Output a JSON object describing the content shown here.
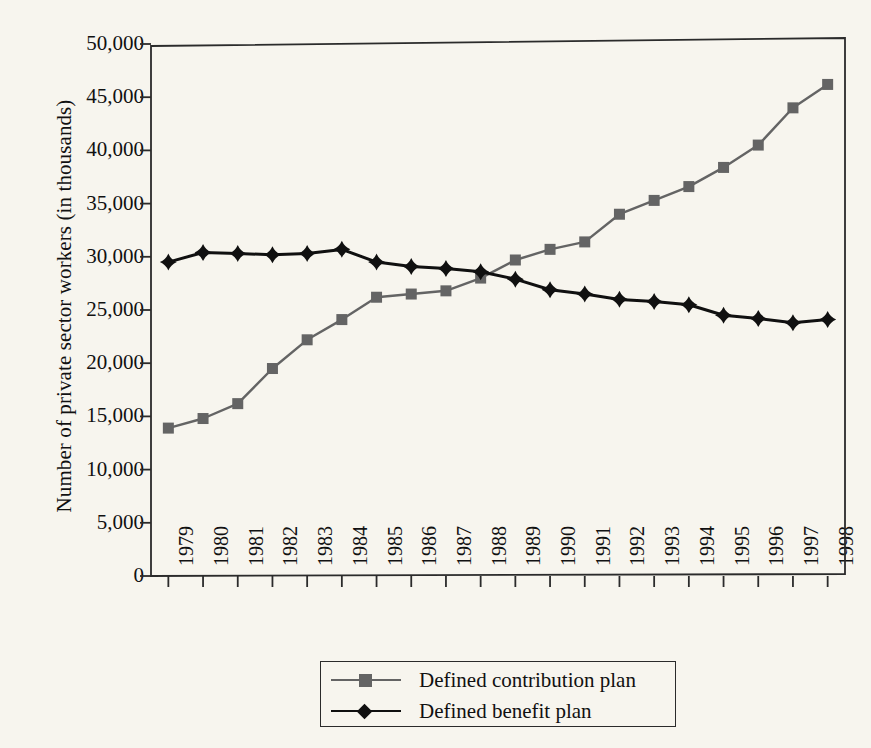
{
  "chart_data": {
    "type": "line",
    "title": "",
    "xlabel": "",
    "ylabel": "Number of private sector workers (in thousands)",
    "x": [
      1979,
      1980,
      1981,
      1982,
      1983,
      1984,
      1985,
      1986,
      1987,
      1988,
      1989,
      1990,
      1991,
      1992,
      1993,
      1994,
      1995,
      1996,
      1997,
      1998
    ],
    "categories": [
      "1979",
      "1980",
      "1981",
      "1982",
      "1983",
      "1984",
      "1985",
      "1986",
      "1987",
      "1988",
      "1989",
      "1990",
      "1991",
      "1992",
      "1993",
      "1994",
      "1995",
      "1996",
      "1997",
      "1998"
    ],
    "series": [
      {
        "name": "Defined contribution plan",
        "marker": "square",
        "color": "#646464",
        "values": [
          13900,
          14800,
          16200,
          19500,
          22200,
          24100,
          26200,
          26500,
          26800,
          28000,
          29700,
          30700,
          31400,
          34000,
          35300,
          36600,
          38400,
          40500,
          44000,
          46200
        ]
      },
      {
        "name": "Defined benefit plan",
        "marker": "diamond",
        "color": "#101010",
        "values": [
          29500,
          30400,
          30300,
          30200,
          30300,
          30700,
          29500,
          29100,
          28900,
          28600,
          27900,
          26900,
          26500,
          26000,
          25800,
          25500,
          24500,
          24200,
          23800,
          24100
        ]
      }
    ],
    "ylim": [
      0,
      50000
    ],
    "yticks": [
      0,
      5000,
      10000,
      15000,
      20000,
      25000,
      30000,
      35000,
      40000,
      45000,
      50000
    ],
    "ytick_labels": [
      "0",
      "5,000",
      "10,000",
      "15,000",
      "20,000",
      "25,000",
      "30,000",
      "35,000",
      "40,000",
      "45,000",
      "50,000"
    ],
    "grid": false,
    "legend_position": "bottom-center"
  },
  "legend": {
    "entries": [
      {
        "label": "Defined contribution plan",
        "marker": "square-marker-icon",
        "color": "#646464"
      },
      {
        "label": "Defined benefit plan",
        "marker": "diamond-marker-icon",
        "color": "#101010"
      }
    ]
  },
  "colors": {
    "background": "#f7f5ee",
    "axis": "#2b2b2b",
    "series_contribution": "#646464",
    "series_benefit": "#101010"
  }
}
